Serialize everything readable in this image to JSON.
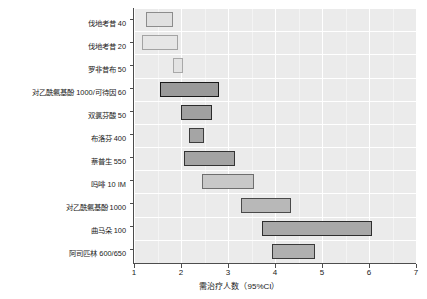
{
  "chart_data": {
    "type": "bar",
    "orientation": "horizontal",
    "subtype": "confidence-interval-range-bars",
    "title": "",
    "xlabel": "需治疗人数（95%CI）",
    "ylabel": "",
    "xlim": [
      1,
      7
    ],
    "ylim": [
      0,
      11
    ],
    "grid": true,
    "grid_color": "#ffffff",
    "panel_background": "#ebebeb",
    "legend": "none",
    "xticks": [
      1,
      2,
      3,
      4,
      5,
      6,
      7
    ],
    "xtick_labels": [
      "1",
      "2",
      "3",
      "4",
      "5",
      "6",
      "7"
    ],
    "categories": [
      "伐地考昔 40",
      "伐地考昔 20",
      "罗非昔布 50",
      "对乙酰氨基酚 1000/可待因 60",
      "双氯芬酸 50",
      "布洛芬 400",
      "萘普生 550",
      "吗啡 10 IM",
      "对乙酰氨基酚 1000",
      "曲马朵 100",
      "阿司匹林 600/650"
    ],
    "series": [
      {
        "name": "需治疗人数（95%CI）",
        "ci_low": [
          1.25,
          1.18,
          1.82,
          1.56,
          1.99,
          2.16,
          2.06,
          2.45,
          3.28,
          3.72,
          3.93
        ],
        "ci_high": [
          1.82,
          1.93,
          2.05,
          2.81,
          2.67,
          2.49,
          3.14,
          3.55,
          4.33,
          6.07,
          4.85
        ],
        "point_estimate": [
          1.54,
          1.56,
          1.94,
          2.19,
          2.33,
          2.33,
          2.6,
          3.0,
          3.81,
          4.9,
          4.39
        ]
      }
    ],
    "bar_fill_colors": [
      "#e0e0e0",
      "#e6e6e6",
      "#e3e3e3",
      "#9a9a9a",
      "#a0a0a0",
      "#a5a5a5",
      "#a3a3a3",
      "#c8c8c8",
      "#b8b8b8",
      "#a8a8a8",
      "#b0b0b0"
    ],
    "bar_border_colors": [
      "#8c8c8c",
      "#a3a3a3",
      "#a8a8a8",
      "#1a1a1a",
      "#2b2b2b",
      "#3d3d3d",
      "#333333",
      "#6e6e6e",
      "#4a4a4a",
      "#2e2e2e",
      "#3a3a3a"
    ]
  },
  "axis": {
    "x_title": "需治疗人数（95%CI）"
  }
}
